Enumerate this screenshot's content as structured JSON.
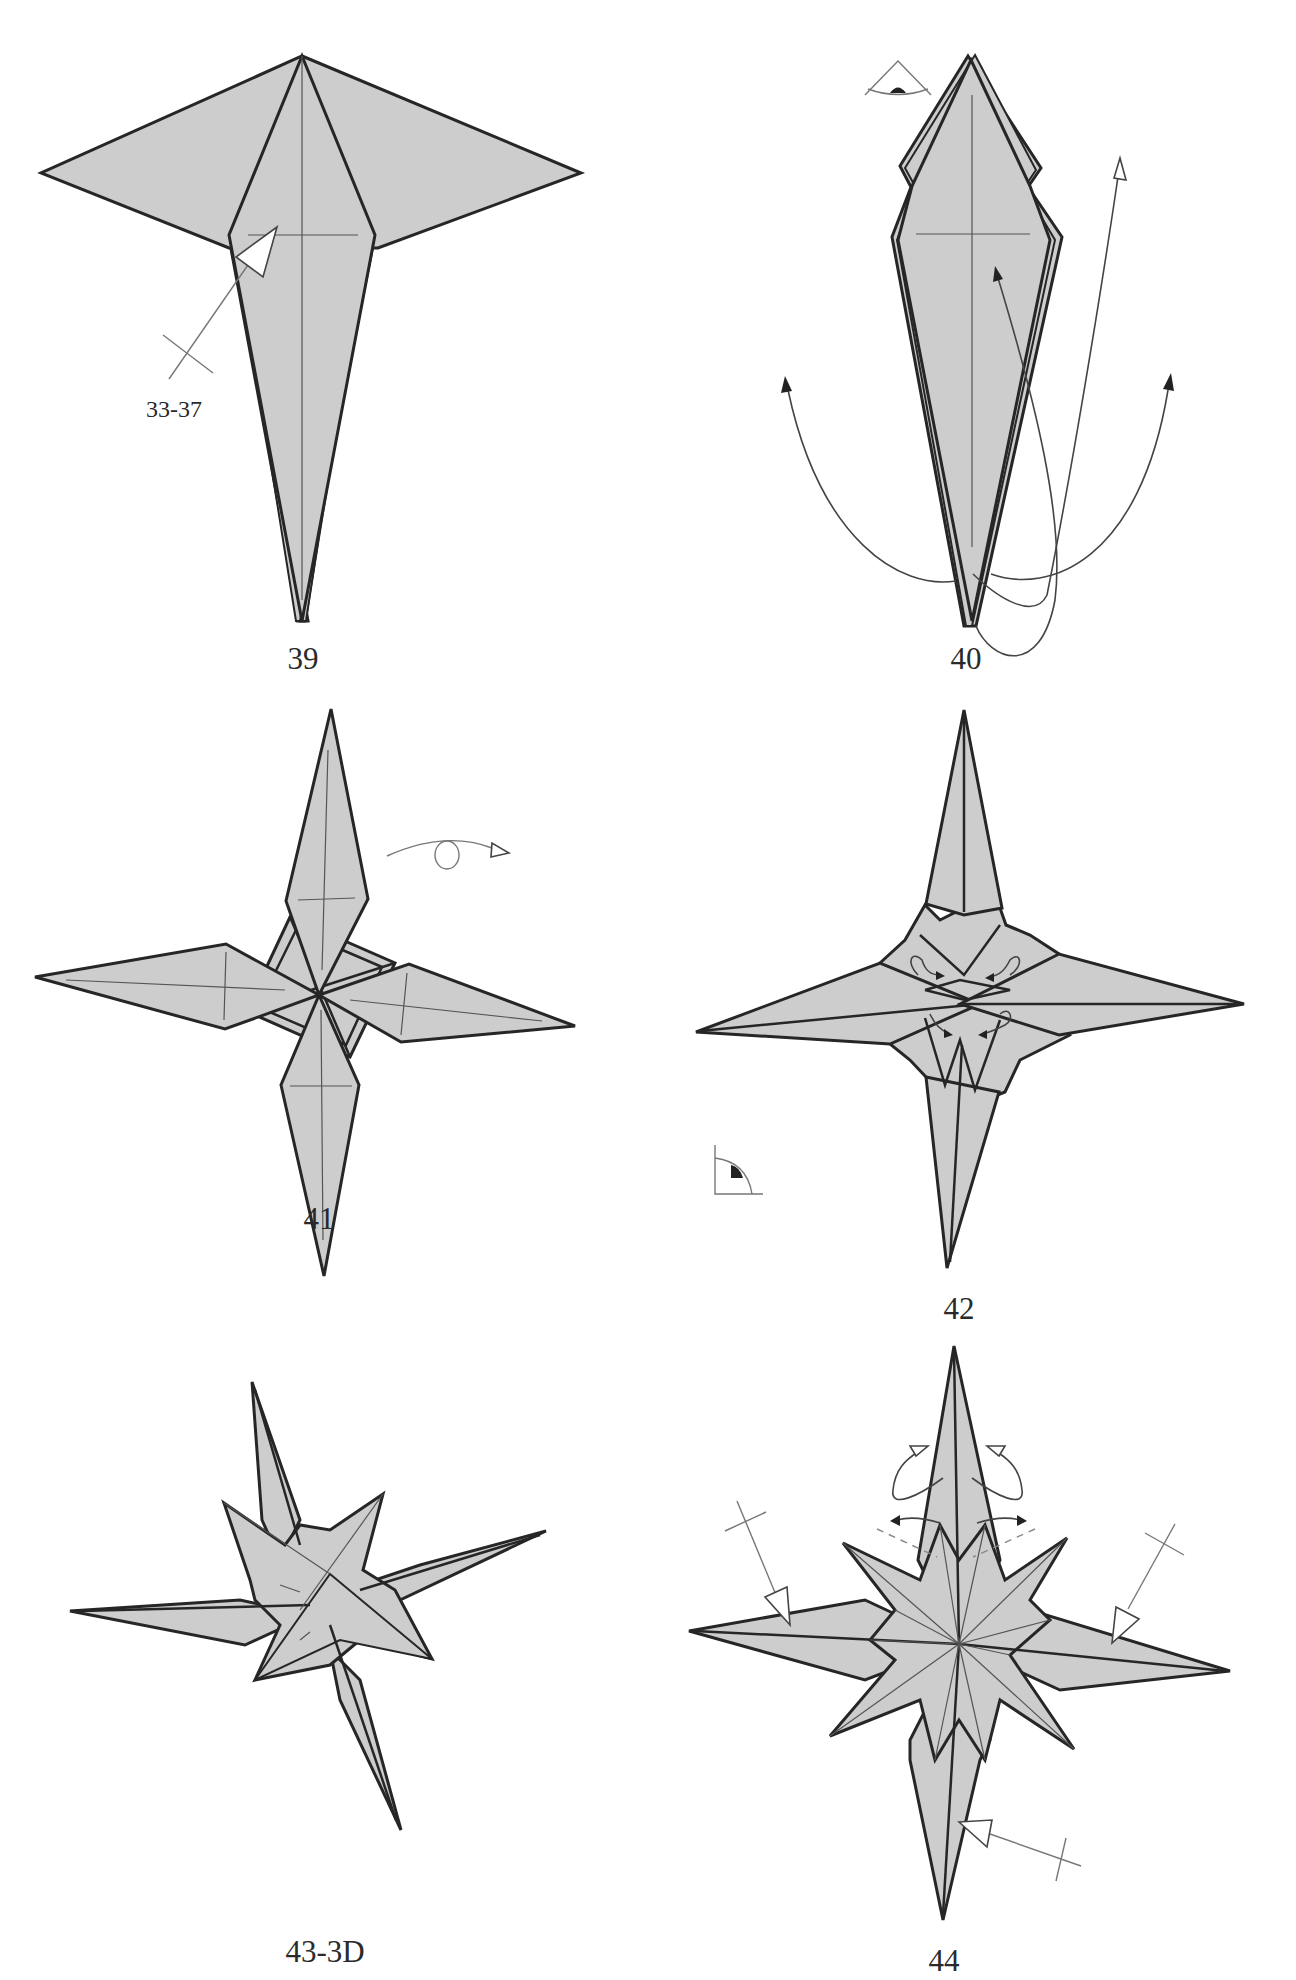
{
  "page": {
    "type": "origami folding diagram page",
    "paper_color": "#cdcdcd",
    "line_color": "#262626"
  },
  "steps": [
    {
      "id": "39",
      "label": "39",
      "annotation": "33-37",
      "symbols": [
        "push-arrow",
        "repeat-reference"
      ]
    },
    {
      "id": "40",
      "label": "40",
      "symbols": [
        "view-from-below-eye",
        "swing-arrow-left",
        "swing-arrow-right",
        "swing-arrow-center",
        "swing-arrow-up"
      ]
    },
    {
      "id": "41",
      "label": "41",
      "symbols": [
        "turn-over-arrow"
      ]
    },
    {
      "id": "42",
      "label": "42",
      "symbols": [
        "view-angle-icon",
        "small-curl-arrows"
      ]
    },
    {
      "id": "43",
      "label": "43-3D",
      "symbols": []
    },
    {
      "id": "44",
      "label": "44",
      "symbols": [
        "push-arrow-left",
        "push-arrow-right",
        "push-arrow-bottom",
        "curl-arrows",
        "double-arrows",
        "dashed-fold-lines"
      ]
    }
  ]
}
